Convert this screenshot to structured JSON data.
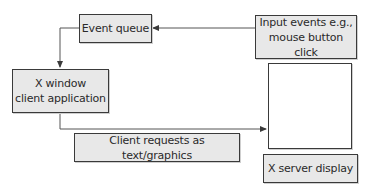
{
  "diagram": {
    "nodes": [
      {
        "id": "event_queue",
        "label": "Event queue"
      },
      {
        "id": "input_events",
        "label": "Input events e.g.,\nmouse button click"
      },
      {
        "id": "client_app",
        "label": "X window\nclient application"
      },
      {
        "id": "client_requests",
        "label": "Client requests as text/graphics"
      },
      {
        "id": "display_screen",
        "label": ""
      },
      {
        "id": "server_display",
        "label": "X server display"
      }
    ],
    "edges": [
      {
        "from": "input_events",
        "to": "event_queue"
      },
      {
        "from": "event_queue",
        "to": "client_app"
      },
      {
        "from": "client_app",
        "to": "display_screen",
        "label": "Client requests as text/graphics"
      }
    ],
    "colors": {
      "box_fill": "#e8e8e8",
      "border": "#3a3a3a",
      "line": "#555555",
      "text": "#2a2a2a"
    }
  }
}
